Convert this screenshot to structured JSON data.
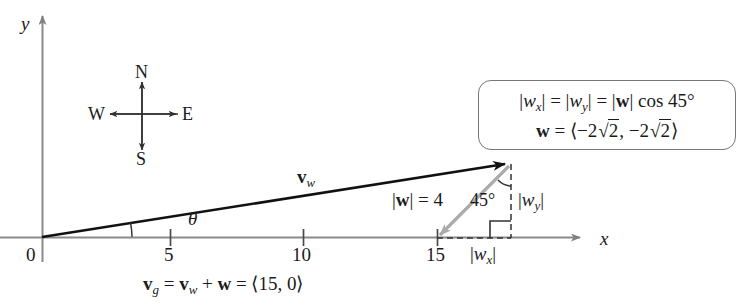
{
  "figure": {
    "type": "vector-diagram",
    "background": "#ffffff",
    "axes": {
      "x_label": "x",
      "y_label": "y",
      "origin_label": "0",
      "x_ticks": [
        "5",
        "10",
        "15"
      ],
      "x_tick_values": [
        5,
        10,
        15
      ],
      "x_axis_color": "#808080",
      "y_axis_color": "#808080"
    },
    "compass": {
      "north": "N",
      "south": "S",
      "east": "E",
      "west": "W"
    },
    "vectors": [
      {
        "name": "v_w",
        "label": "v",
        "label_sub": "w",
        "color": "#111111",
        "from": [
          0,
          0
        ],
        "to": [
          15.0,
          2.83
        ],
        "description": "air velocity vector from origin to arrowhead"
      },
      {
        "name": "w",
        "label": "w",
        "color": "#a8a8a8",
        "from": [
          15.0,
          2.83
        ],
        "to": [
          12.2,
          0
        ],
        "magnitude": 4,
        "magnitude_label": "|w| = 4",
        "description": "wind vector, gray, pointing down-left"
      }
    ],
    "angles": {
      "theta": "θ",
      "forty_five": "45°"
    },
    "component_labels": {
      "wx": "|w_x|",
      "wy": "|w_y|"
    },
    "callout": {
      "line1": "|w_x| = |w_y| = |w| cos 45°",
      "line2": "w = ⟨ −2√2, −2√2 ⟩",
      "border_color": "#777777"
    },
    "caption": "v_g = v_w + w = ⟨15, 0⟩",
    "caption_parts": {
      "lhs": "v",
      "lhs_sub": "g",
      "eq1": "=",
      "term": "v",
      "term_sub": "w",
      "plus": "+",
      "w": "w",
      "eq2": "=",
      "result": "⟨15, 0⟩"
    }
  }
}
